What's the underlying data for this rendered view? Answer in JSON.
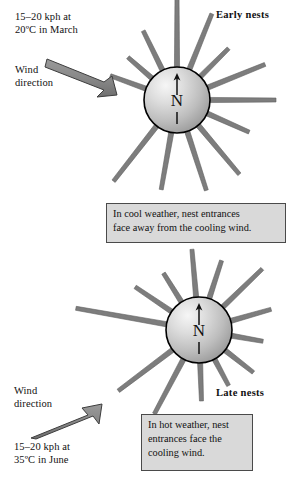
{
  "figure": {
    "colors": {
      "ray": "#7d7d7d",
      "ray_outline": "#5d5d5d",
      "sphere_light": "#f2f2f2",
      "sphere_mid": "#c9c9c9",
      "sphere_dark": "#9a9a9a",
      "sphere_outline": "#000000",
      "arrow_fill": "#8a8a8a",
      "arrow_outline": "#3d3d3d",
      "caption_bg": "#d9d9d9",
      "caption_border": "#4a4a4a",
      "text": "#111111",
      "background": "#ffffff"
    }
  },
  "panels": [
    {
      "id": "early",
      "nest_label": "Early nests",
      "wind_spec": "15–20 kph at\n20ºC in March",
      "wind_direction_label": "Wind\ndirection",
      "wind_arrow_direction": "southeast",
      "compass_letter": "N",
      "caption": "In cool weather, nest entrances\nface away from the cooling wind.",
      "nest_center": {
        "x": 177,
        "y": 100
      },
      "nest_radius": 33,
      "rays": [
        {
          "angle_deg": 90,
          "length": 72
        },
        {
          "angle_deg": 68,
          "length": 60
        },
        {
          "angle_deg": 45,
          "length": 40
        },
        {
          "angle_deg": 22,
          "length": 62
        },
        {
          "angle_deg": 0,
          "length": 66
        },
        {
          "angle_deg": -24,
          "length": 46
        },
        {
          "angle_deg": -50,
          "length": 64
        },
        {
          "angle_deg": -72,
          "length": 62
        },
        {
          "angle_deg": -100,
          "length": 58
        },
        {
          "angle_deg": -128,
          "length": 70
        },
        {
          "angle_deg": 160,
          "length": 38
        },
        {
          "angle_deg": 139,
          "length": 32
        },
        {
          "angle_deg": 116,
          "length": 44
        }
      ]
    },
    {
      "id": "late",
      "nest_label": "Late nests",
      "wind_spec": "15–20 kph at\n35ºC in June",
      "wind_direction_label": "Wind\ndirection",
      "wind_arrow_direction": "northeast",
      "compass_letter": "N",
      "caption": "In hot weather, nest\nentrances face the\ncooling wind.",
      "nest_center": {
        "x": 199,
        "y": 330
      },
      "nest_radius": 33,
      "rays": [
        {
          "angle_deg": 95,
          "length": 48
        },
        {
          "angle_deg": 72,
          "length": 40
        },
        {
          "angle_deg": 44,
          "length": 55
        },
        {
          "angle_deg": 16,
          "length": 42
        },
        {
          "angle_deg": -10,
          "length": 32
        },
        {
          "angle_deg": -38,
          "length": 36
        },
        {
          "angle_deg": -62,
          "length": 30
        },
        {
          "angle_deg": -88,
          "length": 38
        },
        {
          "angle_deg": -118,
          "length": 62
        },
        {
          "angle_deg": -143,
          "length": 68
        },
        {
          "angle_deg": 170,
          "length": 92
        },
        {
          "angle_deg": 146,
          "length": 44
        },
        {
          "angle_deg": 122,
          "length": 34
        }
      ]
    }
  ]
}
